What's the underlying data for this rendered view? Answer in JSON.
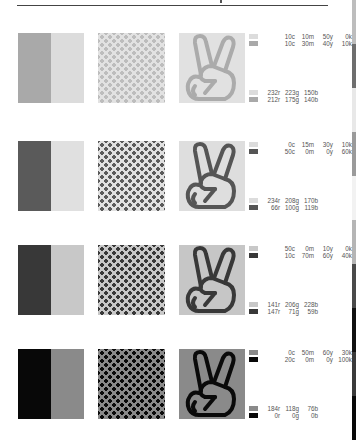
{
  "rows": [
    {
      "bar_colors": [
        "#a9a9a9",
        "#dcdcdc"
      ],
      "checker_colors": [
        "#bdbdbd",
        "#e2e2e2"
      ],
      "hand_bg": "#e1e1e1",
      "hand_stroke": "#ababab",
      "swatch_colors": [
        "#dcdcdc",
        "#a9a9a9"
      ],
      "cmyk": [
        [
          "10c",
          "10m",
          "50y",
          "0k"
        ],
        [
          "10c",
          "30m",
          "40y",
          "10k"
        ]
      ],
      "rgb": [
        [
          "232r",
          "223g",
          "150b"
        ],
        [
          "212r",
          "175g",
          "140b"
        ]
      ]
    },
    {
      "bar_colors": [
        "#5a5a5a",
        "#e0e0e0"
      ],
      "checker_colors": [
        "#5a5a5a",
        "#e0e0e0"
      ],
      "hand_bg": "#dedede",
      "hand_stroke": "#555555",
      "swatch_colors": [
        "#dcdcdc",
        "#555555"
      ],
      "cmyk": [
        [
          "0c",
          "15m",
          "30y",
          "10k"
        ],
        [
          "50c",
          "0m",
          "0y",
          "60k"
        ]
      ],
      "rgb": [
        [
          "234r",
          "208g",
          "170b"
        ],
        [
          "66r",
          "100g",
          "119b"
        ]
      ]
    },
    {
      "bar_colors": [
        "#383838",
        "#c8c8c8"
      ],
      "checker_colors": [
        "#383838",
        "#c8c8c8"
      ],
      "hand_bg": "#c6c6c6",
      "hand_stroke": "#383838",
      "swatch_colors": [
        "#c8c8c8",
        "#383838"
      ],
      "cmyk": [
        [
          "50c",
          "0m",
          "10y",
          "0k"
        ],
        [
          "10c",
          "70m",
          "60y",
          "40k"
        ]
      ],
      "rgb": [
        [
          "141r",
          "206g",
          "228b"
        ],
        [
          "147r",
          "71g",
          "59b"
        ]
      ]
    },
    {
      "bar_colors": [
        "#080808",
        "#8a8a8a"
      ],
      "checker_colors": [
        "#0a0a0a",
        "#8a8a8a"
      ],
      "hand_bg": "#8a8a8a",
      "hand_stroke": "#0a0a0a",
      "swatch_colors": [
        "#8a8a8a",
        "#080808"
      ],
      "cmyk": [
        [
          "0c",
          "50m",
          "60y",
          "30k"
        ],
        [
          "20c",
          "0m",
          "0y",
          "100k"
        ]
      ],
      "rgb": [
        [
          "184r",
          "118g",
          "76b"
        ],
        [
          "0r",
          "0g",
          "0b"
        ]
      ]
    }
  ],
  "edge_strip": [
    "#bdbdbd",
    "#6e6e6e",
    "#e8e8e8",
    "#9a9a9a",
    "#f2f2f2",
    "#b5b5b5",
    "#4a4a4a",
    "#111111",
    "#3a3a3a",
    "#080808"
  ]
}
